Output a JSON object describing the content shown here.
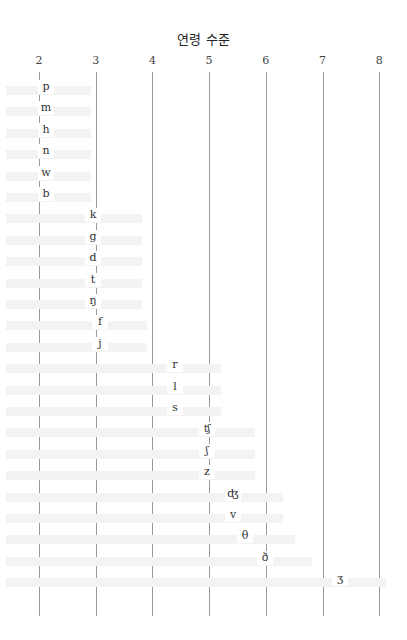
{
  "chart_data": {
    "type": "table",
    "title": "연령 수준",
    "xlabel": "연령 수준",
    "ylabel": "",
    "x_ticks": [
      "2",
      "3",
      "4",
      "5",
      "6",
      "7",
      "8"
    ],
    "xlim": [
      2,
      8
    ],
    "grid": true,
    "rows": [
      {
        "sound": "p",
        "age": 2.1
      },
      {
        "sound": "m",
        "age": 2.1
      },
      {
        "sound": "h",
        "age": 2.1
      },
      {
        "sound": "n",
        "age": 2.1
      },
      {
        "sound": "w",
        "age": 2.1
      },
      {
        "sound": "b",
        "age": 2.1
      },
      {
        "sound": "k",
        "age": 3.0
      },
      {
        "sound": "g",
        "age": 3.0
      },
      {
        "sound": "d",
        "age": 3.0
      },
      {
        "sound": "t",
        "age": 3.0
      },
      {
        "sound": "ŋ",
        "age": 3.0
      },
      {
        "sound": "f",
        "age": 3.1
      },
      {
        "sound": "j",
        "age": 3.1
      },
      {
        "sound": "r",
        "age": 4.4
      },
      {
        "sound": "l",
        "age": 4.4
      },
      {
        "sound": "s",
        "age": 4.4
      },
      {
        "sound": "ʧ",
        "age": 5.0
      },
      {
        "sound": "ʃ",
        "age": 5.0
      },
      {
        "sound": "z",
        "age": 5.0
      },
      {
        "sound": "ʤ",
        "age": 5.5
      },
      {
        "sound": "v",
        "age": 5.5
      },
      {
        "sound": "θ",
        "age": 5.7
      },
      {
        "sound": "ð",
        "age": 6.0
      },
      {
        "sound": "ʒ",
        "age": 7.3
      }
    ]
  }
}
